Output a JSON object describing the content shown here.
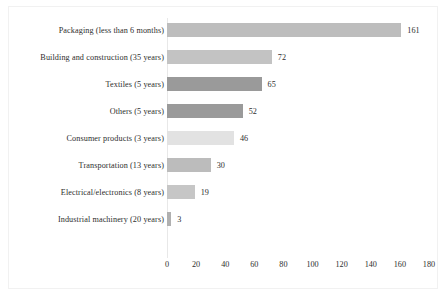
{
  "chart_data": {
    "type": "bar",
    "orientation": "horizontal",
    "title": "",
    "xlabel": "",
    "ylabel": "",
    "xlim": [
      0,
      180
    ],
    "xticks": [
      0,
      20,
      40,
      60,
      80,
      100,
      120,
      140,
      160,
      180
    ],
    "grid": false,
    "legend": "none",
    "categories": [
      "Packaging (less than 6 months)",
      "Building and construction (35 years)",
      "Textiles (5 years)",
      "Others (5 years)",
      "Consumer products (3 years)",
      "Transportation (13 years)",
      "Electrical/electronics (8 years)",
      "Industrial machinery (20 years)"
    ],
    "values": [
      161,
      72,
      65,
      52,
      46,
      30,
      19,
      3
    ],
    "value_labels": [
      "161",
      "72",
      "65",
      "52",
      "46",
      "30",
      "19",
      "3"
    ],
    "bar_colors": [
      "#bdbdbd",
      "#c3c3c3",
      "#9a9a9a",
      "#9a9a9a",
      "#e2e2e2",
      "#bcbcbc",
      "#c6c6c6",
      "#b0b0b0"
    ]
  }
}
